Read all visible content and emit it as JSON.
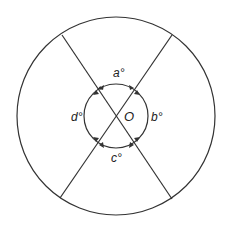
{
  "diagram": {
    "type": "geometry-circle-angles",
    "center_label": "O",
    "angle_labels": {
      "top": "a°",
      "right": "b°",
      "bottom": "c°",
      "left": "d°"
    },
    "stroke_color": "#333333",
    "background_color": "#ffffff"
  }
}
